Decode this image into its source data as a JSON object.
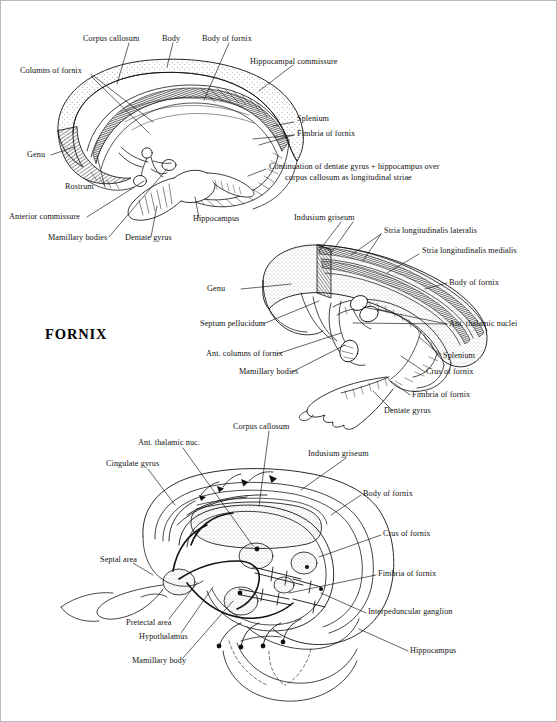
{
  "page": {
    "title": "FORNIX",
    "figure_type": "anatomical-line-drawing",
    "panel_count": 3
  },
  "panels": [
    {
      "id": "top",
      "name": "fornix-medial-view",
      "labels": [
        {
          "id": "corpus-callosum",
          "text": "Corpus callosum",
          "x": 82,
          "y": 33
        },
        {
          "id": "body",
          "text": "Body",
          "x": 161,
          "y": 33
        },
        {
          "id": "body-of-fornix",
          "text": "Body of fornix",
          "x": 201,
          "y": 33
        },
        {
          "id": "hippocampal-commissure",
          "text": "Hippocampal commissure",
          "x": 249,
          "y": 56
        },
        {
          "id": "columns-of-fornix",
          "text": "Columns of fornix",
          "x": 19,
          "y": 65
        },
        {
          "id": "splenium",
          "text": "Splenium",
          "x": 296,
          "y": 118
        },
        {
          "id": "fimbria-of-fornix",
          "text": "Fimbria of fornix",
          "x": 296,
          "y": 131
        },
        {
          "id": "genu",
          "text": "Genu",
          "x": 26,
          "y": 151
        },
        {
          "id": "rostrum",
          "text": "Rostrum",
          "x": 64,
          "y": 186
        },
        {
          "id": "anterior-commissure",
          "text": "Anterior commissure",
          "x": 8,
          "y": 214
        },
        {
          "id": "mamillary-bodies",
          "text": "Mamillary bodies",
          "x": 47,
          "y": 238
        },
        {
          "id": "dentate-gyrus",
          "text": "Dentate gyrus",
          "x": 124,
          "y": 238
        },
        {
          "id": "hippocampus",
          "text": "Hippocampus",
          "x": 192,
          "y": 221
        }
      ],
      "multiline_labels": [
        {
          "id": "continuation-note",
          "line1": "Continuation of dentate gyrus + hippocampus over",
          "line2": "corpus callosum as longitudinal striae",
          "x": 268,
          "y": 165
        }
      ]
    },
    {
      "id": "middle",
      "name": "fornix-oblique-view",
      "labels": [
        {
          "id": "indusium-griseum",
          "text": "Indusium griseum",
          "x": 293,
          "y": 216
        },
        {
          "id": "stria-longitudinalis-lateralis",
          "text": "Stria longitudinalis lateralis",
          "x": 383,
          "y": 229
        },
        {
          "id": "stria-longitudinalis-medialis",
          "text": "Stria longitudinalis medialis",
          "x": 421,
          "y": 249
        },
        {
          "id": "genu-mid",
          "text": "Genu",
          "x": 206,
          "y": 285
        },
        {
          "id": "body-of-fornix-mid",
          "text": "Body of fornix",
          "x": 448,
          "y": 279
        },
        {
          "id": "septum-pellucidum",
          "text": "Septum pellucidum",
          "x": 199,
          "y": 320
        },
        {
          "id": "ant-thalamic-nuclei",
          "text": "Ant. thalamic nuclei",
          "x": 448,
          "y": 320
        },
        {
          "id": "ant-columns-of-fornix",
          "text": "Ant. columns of fornix",
          "x": 205,
          "y": 350
        },
        {
          "id": "splenium-mid",
          "text": "Splenium",
          "x": 442,
          "y": 352
        },
        {
          "id": "mamillary-bodies-mid",
          "text": "Mamillary bodies",
          "x": 238,
          "y": 368
        },
        {
          "id": "crus-of-fornix-mid",
          "text": "Crus of fornix",
          "x": 425,
          "y": 368
        },
        {
          "id": "fimbria-of-fornix-mid",
          "text": "Fimbria of fornix",
          "x": 411,
          "y": 391
        },
        {
          "id": "dentate-gyrus-mid",
          "text": "Dentate gyrus",
          "x": 383,
          "y": 407
        }
      ],
      "multiline_labels": []
    },
    {
      "id": "bottom",
      "name": "fornix-circuit-diagram",
      "labels": [
        {
          "id": "corpus-callosum-bot",
          "text": "Corpus callosum",
          "x": 232,
          "y": 424
        },
        {
          "id": "ant-thalamic-nuc",
          "text": "Ant. thalamic nuc.",
          "x": 137,
          "y": 440
        },
        {
          "id": "indusium-griseum-bot",
          "text": "Indusium griseum",
          "x": 307,
          "y": 451
        },
        {
          "id": "cingulate-gyrus",
          "text": "Cingulate gyrus",
          "x": 105,
          "y": 461
        },
        {
          "id": "body-of-fornix-bot",
          "text": "Body of fornix",
          "x": 362,
          "y": 490
        },
        {
          "id": "crus-of-fornix-bot",
          "text": "Crus of fornix",
          "x": 382,
          "y": 530
        },
        {
          "id": "septal-area",
          "text": "Septal area",
          "x": 99,
          "y": 557
        },
        {
          "id": "fimbria-of-fornix-bot",
          "text": "Fimbria of fornix",
          "x": 377,
          "y": 571
        },
        {
          "id": "interpeduncular-ganglion",
          "text": "Interpeduncular ganglion",
          "x": 367,
          "y": 609
        },
        {
          "id": "pretectal-area",
          "text": "Pretectal area",
          "x": 125,
          "y": 620
        },
        {
          "id": "hypothalamus",
          "text": "Hypothalamus",
          "x": 138,
          "y": 634
        },
        {
          "id": "hippocampus-bot",
          "text": "Hippocampus",
          "x": 409,
          "y": 648
        },
        {
          "id": "mamillary-body",
          "text": "Mamillary body",
          "x": 131,
          "y": 658
        }
      ],
      "multiline_labels": []
    }
  ],
  "colors": {
    "ink": "#111111",
    "stipple": "#555555",
    "page": "#ffffff",
    "border": "#b9b9b9"
  }
}
